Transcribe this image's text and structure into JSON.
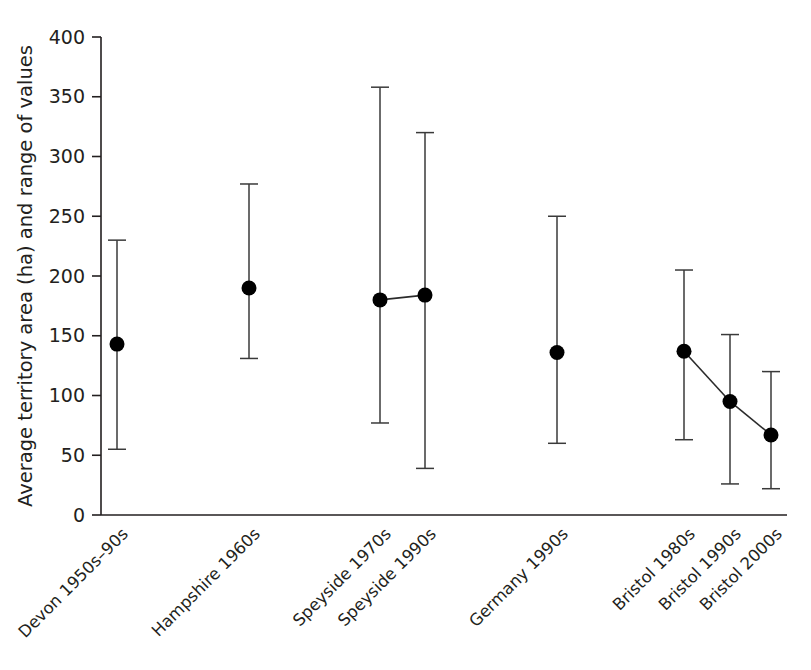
{
  "chart_data": {
    "type": "scatter",
    "title": "",
    "xlabel": "",
    "ylabel": "Average territory area (ha) and range of values",
    "ylim": [
      0,
      400
    ],
    "yticks": [
      0,
      50,
      100,
      150,
      200,
      250,
      300,
      350,
      400
    ],
    "ytick_labels": [
      "0",
      "50",
      "100",
      "150",
      "200",
      "250",
      "300",
      "350",
      "400"
    ],
    "grid": false,
    "legend": "none",
    "categories": [
      "Devon 1950s–90s",
      "Hampshire 1960s",
      "Speyside 1970s",
      "Speyside 1990s",
      "Germany 1990s",
      "Bristol 1980s",
      "Bristol 1990s",
      "Bristol 2000s"
    ],
    "values": [
      143,
      190,
      180,
      184,
      136,
      137,
      95,
      67
    ],
    "range_low": [
      55,
      131,
      77,
      39,
      60,
      63,
      26,
      22
    ],
    "range_high": [
      230,
      277,
      358,
      320,
      250,
      205,
      151,
      120
    ],
    "points": [
      {
        "label": "Devon 1950s–90s",
        "x": 117,
        "mean": 143,
        "low": 55,
        "high": 230
      },
      {
        "label": "Hampshire 1960s",
        "x": 249,
        "mean": 190,
        "low": 131,
        "high": 277
      },
      {
        "label": "Speyside 1970s",
        "x": 380,
        "mean": 180,
        "low": 77,
        "high": 358
      },
      {
        "label": "Speyside 1990s",
        "x": 425,
        "mean": 184,
        "low": 39,
        "high": 320
      },
      {
        "label": "Germany 1990s",
        "x": 557,
        "mean": 136,
        "low": 60,
        "high": 250
      },
      {
        "label": "Bristol 1980s",
        "x": 684,
        "mean": 137,
        "low": 63,
        "high": 205
      },
      {
        "label": "Bristol 1990s",
        "x": 730,
        "mean": 95,
        "low": 26,
        "high": 151
      },
      {
        "label": "Bristol 2000s",
        "x": 771,
        "mean": 67,
        "low": 22,
        "high": 120
      }
    ],
    "connections": [
      {
        "from": "Speyside 1970s",
        "to": "Speyside 1990s"
      },
      {
        "from": "Bristol 1980s",
        "to": "Bristol 1990s"
      },
      {
        "from": "Bristol 1990s",
        "to": "Bristol 2000s"
      }
    ],
    "marker_color": "#000000",
    "errorbar_color": "#3a3a3a",
    "axis_color": "#231f20"
  }
}
